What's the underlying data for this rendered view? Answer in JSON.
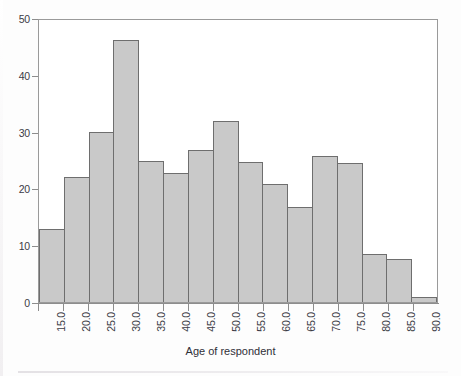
{
  "chart_data": {
    "type": "bar",
    "title": "",
    "subtitle": "",
    "xlabel": "Age of respondent",
    "ylabel": "",
    "categories": [
      "15.0",
      "20.0",
      "25.0",
      "30.0",
      "35.0",
      "40.0",
      "45.0",
      "50.0",
      "55.0",
      "60.0",
      "65.0",
      "70.0",
      "75.0",
      "80.0",
      "85.0",
      "90.0"
    ],
    "values": [
      12.9,
      22.0,
      30.0,
      46.2,
      24.8,
      22.8,
      26.7,
      31.8,
      24.7,
      20.7,
      16.7,
      25.7,
      24.4,
      8.5,
      7.5,
      0.8
    ],
    "bin_edges": [
      15,
      20,
      25,
      30,
      35,
      40,
      45,
      50,
      55,
      60,
      65,
      70,
      75,
      80,
      85,
      90,
      95
    ],
    "bin_labels": [
      "15.0",
      "20.0",
      "25.0",
      "30.0",
      "35.0",
      "40.0",
      "45.0",
      "50.0",
      "55.0",
      "60.0",
      "65.0",
      "70.0",
      "75.0",
      "80.0",
      "85.0",
      "90.0"
    ],
    "ylim": [
      0,
      50
    ],
    "yticks": [
      0,
      10,
      20,
      30,
      40,
      50
    ],
    "ytick_labels": [
      "0",
      "10",
      "20",
      "30",
      "40",
      "50"
    ],
    "xlim": [
      15,
      95
    ],
    "xticks": [
      15,
      20,
      25,
      30,
      35,
      40,
      45,
      50,
      55,
      60,
      65,
      70,
      75,
      80,
      85,
      90
    ],
    "grid": false,
    "legend": false,
    "legend_position": "none",
    "bar_fill_color": "#c9c9c9",
    "bar_edge_color": "#6e6e6e",
    "axis_color": "#8d8d8d",
    "text_color": "#3b3b45",
    "background_color": "#fdfdfd",
    "xtick_label_rotation": 90
  }
}
